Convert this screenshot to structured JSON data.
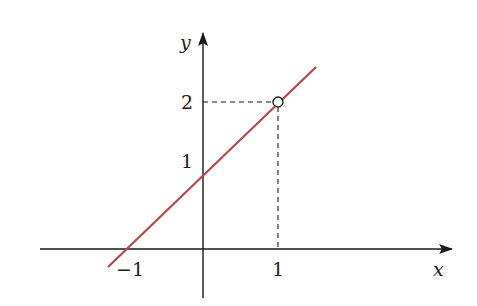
{
  "diagram": {
    "title": "",
    "function": "y = x + 1",
    "axes": {
      "x_label": "x",
      "y_label": "y"
    },
    "ticks": {
      "x": [
        {
          "value": -1,
          "label": "−1"
        },
        {
          "value": 1,
          "label": "1"
        }
      ],
      "y": [
        {
          "value": 1,
          "label": "1"
        },
        {
          "value": 2,
          "label": "2"
        }
      ]
    },
    "line": {
      "color": "#b5484a",
      "from": [
        -1.27,
        -0.25
      ],
      "to": [
        1.5,
        2.5
      ]
    },
    "hollow_point": {
      "x": 1,
      "y": 2
    },
    "guides": {
      "style": "dashed",
      "to_point": [
        1,
        2
      ]
    }
  },
  "colors": {
    "axis": "#1a1a1a",
    "line": "#b5484a",
    "background": "#ffffff"
  }
}
